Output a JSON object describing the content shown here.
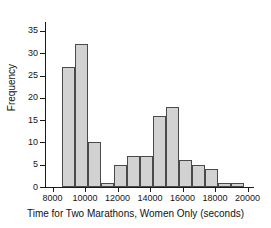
{
  "chart_data": {
    "type": "bar",
    "title": "",
    "subtitle": "",
    "xlabel": "Time for Two Marathons, Women Only (seconds)",
    "ylabel": "Frequency",
    "xlim": [
      7600,
      20400
    ],
    "ylim": [
      0,
      37
    ],
    "grid": false,
    "legend": null,
    "bin_width": 800,
    "xticks": [
      8000,
      10000,
      12000,
      14000,
      16000,
      18000,
      20000
    ],
    "xtick_labels": [
      "8000",
      "10000",
      "12000",
      "14000",
      "16000",
      "18000",
      "20000"
    ],
    "yticks": [
      0,
      5,
      10,
      15,
      20,
      25,
      30,
      35
    ],
    "ytick_labels": [
      "0",
      "5",
      "10",
      "15",
      "20",
      "25",
      "30",
      "35"
    ],
    "bins": [
      {
        "start": 8600,
        "end": 9400,
        "value": 27
      },
      {
        "start": 9400,
        "end": 10200,
        "value": 32
      },
      {
        "start": 10200,
        "end": 11000,
        "value": 10
      },
      {
        "start": 11000,
        "end": 11800,
        "value": 1
      },
      {
        "start": 11800,
        "end": 12600,
        "value": 5
      },
      {
        "start": 12600,
        "end": 13400,
        "value": 7
      },
      {
        "start": 13400,
        "end": 14200,
        "value": 7
      },
      {
        "start": 14200,
        "end": 15000,
        "value": 16
      },
      {
        "start": 15000,
        "end": 15800,
        "value": 18
      },
      {
        "start": 15800,
        "end": 16600,
        "value": 6
      },
      {
        "start": 16600,
        "end": 17400,
        "value": 5
      },
      {
        "start": 17400,
        "end": 18200,
        "value": 4
      },
      {
        "start": 18200,
        "end": 19000,
        "value": 1
      },
      {
        "start": 19000,
        "end": 19800,
        "value": 1
      }
    ],
    "categories": [
      "8600-9400",
      "9400-10200",
      "10200-11000",
      "11000-11800",
      "11800-12600",
      "12600-13400",
      "13400-14200",
      "14200-15000",
      "15000-15800",
      "15800-16600",
      "16600-17400",
      "17400-18200",
      "18200-19000",
      "19000-19800"
    ],
    "values": [
      27,
      32,
      10,
      1,
      5,
      7,
      7,
      16,
      18,
      6,
      5,
      4,
      1,
      1
    ],
    "colors": {
      "bar_fill": "#d2d2d2",
      "bar_stroke": "#4a4a4a",
      "axis": "#1a1a1a",
      "text": "#151515",
      "background": "#ffffff"
    }
  }
}
